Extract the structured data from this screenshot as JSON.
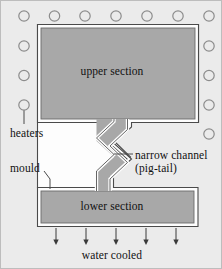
{
  "figure": {
    "kind": "technical-cross-section-diagram",
    "background_color": "#ebebeb",
    "frame_border_color": "#bdbdbd"
  },
  "colors": {
    "metal_fill": "#a8a8a8",
    "mould_outline": "#fdfdfd",
    "outline_stroke": "#4a4a4a",
    "heater_circle_stroke": "#8c8c8c",
    "channel_fill": "#a8a8a8",
    "arrow_color": "#3a3a3a",
    "text_color": "#111111"
  },
  "labels": {
    "upper_section": "upper section",
    "lower_section": "lower section",
    "heaters": "heaters",
    "mould": "mould",
    "narrow_channel_line1": "narrow channel",
    "narrow_channel_line2": "(pig-tail)",
    "water_cooled": "water cooled"
  },
  "heaters": {
    "count_total": 14,
    "radius": 5.2,
    "top_row": {
      "count": 7,
      "y": 15,
      "x_positions": [
        23,
        53.5,
        84,
        115,
        146,
        177,
        208
      ]
    },
    "left_column": {
      "count": 3,
      "x": 23,
      "y_positions": [
        45,
        74.5,
        104
      ]
    },
    "right_column": {
      "count": 4,
      "x": 208,
      "y_positions": [
        45,
        74.5,
        104,
        133
      ]
    },
    "leader_from": {
      "x": 23,
      "y": 109
    },
    "leader_to": {
      "x": 23,
      "y": 123
    }
  },
  "upper_section": {
    "x": 40,
    "y": 27,
    "width": 154,
    "height": 91
  },
  "lower_section": {
    "x": 40,
    "y": 190,
    "width": 153,
    "height": 32
  },
  "narrow_channel": {
    "description": "zig-zag (pig-tail) channel linking upper and lower sections",
    "top_opening_x": [
      113,
      126
    ],
    "bottom_opening_x": [
      113,
      126
    ],
    "top_y": 118,
    "bottom_y": 190
  },
  "water_cooling_arrows": {
    "count": 5,
    "x_positions": [
      55,
      85,
      115,
      145,
      175
    ],
    "y_top": 227,
    "y_bottom": 243
  },
  "leaders": {
    "mould": {
      "from": [
        44,
        170
      ],
      "to": [
        56,
        186
      ]
    },
    "narrow_channel": {
      "from": [
        112,
        153
      ],
      "to": [
        131,
        153
      ]
    }
  }
}
